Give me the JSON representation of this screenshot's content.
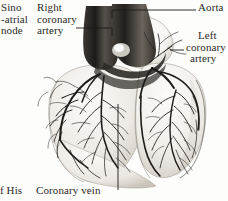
{
  "figure": {
    "background_color": "#fdfdfc",
    "ink_color": "#2b2a28",
    "width": 228,
    "height": 201
  },
  "labels": {
    "sino_atrial_node": {
      "line1": "Sino",
      "line2": "-atrial",
      "line3": "node"
    },
    "right_coronary_artery": {
      "line1": "Right",
      "line2": "coronary",
      "line3": "artery"
    },
    "aorta": {
      "text": "Aorta"
    },
    "left_coronary_artery": {
      "line1": "Left",
      "line2": "coronary",
      "line3": "artery"
    },
    "coronary_vein": {
      "text": "Coronary vein"
    },
    "bundle_of_his": {
      "text": "f His"
    }
  }
}
